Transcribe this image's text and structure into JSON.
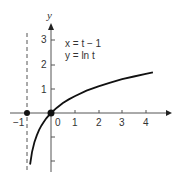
{
  "chart_data": {
    "type": "line",
    "title": "",
    "xlabel": "",
    "ylabel": "y",
    "xlim": [
      -1.2,
      5.1
    ],
    "ylim": [
      -2.3,
      3.6
    ],
    "grid": false,
    "annotations": [
      "x = t − 1",
      "y = ln t"
    ],
    "x_ticks": [
      -1,
      0,
      1,
      2,
      3,
      4
    ],
    "x_tick_labels": [
      "−1",
      "0",
      "1",
      "2",
      "3",
      "4"
    ],
    "y_ticks": [
      -2,
      -1,
      1,
      2,
      3
    ],
    "y_tick_labels": [
      "",
      "",
      "1",
      "2",
      "3"
    ],
    "asymptote": {
      "x": -1,
      "style": "dashed"
    },
    "points": [
      {
        "x": -1,
        "y": 0
      },
      {
        "x": 0,
        "y": 0
      }
    ],
    "series": [
      {
        "name": "y = ln(x + 1)",
        "x": [
          -0.88,
          -0.8,
          -0.7,
          -0.6,
          -0.5,
          -0.4,
          -0.3,
          -0.2,
          -0.1,
          0,
          0.25,
          0.5,
          0.75,
          1,
          1.5,
          2,
          2.5,
          3,
          3.5,
          4,
          4.3
        ],
        "values": [
          -2.12,
          -1.61,
          -1.2,
          -0.92,
          -0.69,
          -0.51,
          -0.36,
          -0.22,
          -0.11,
          0,
          0.22,
          0.41,
          0.56,
          0.69,
          0.92,
          1.1,
          1.25,
          1.39,
          1.5,
          1.61,
          1.67
        ]
      }
    ]
  },
  "labels": {
    "y_axis": "y",
    "eq1": "x = t − 1",
    "eq2": "y = ln t",
    "xt_m1": "−1",
    "xt_0": "0",
    "xt_1": "1",
    "xt_2": "2",
    "xt_3": "3",
    "xt_4": "4",
    "yt_1": "1",
    "yt_2": "2",
    "yt_3": "3"
  }
}
